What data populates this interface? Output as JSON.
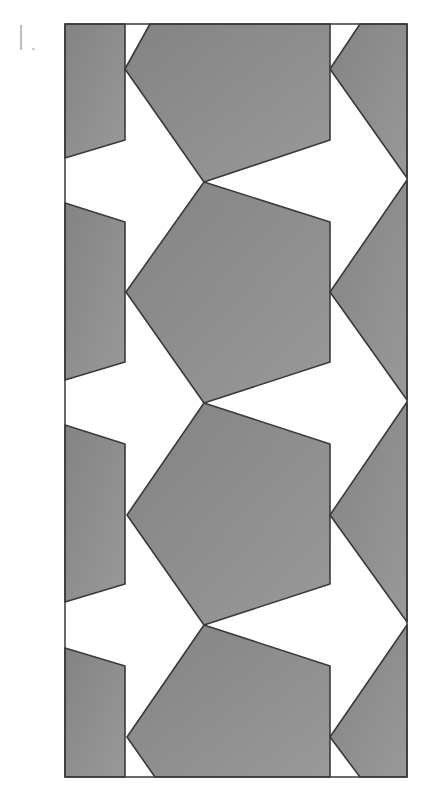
{
  "figure": {
    "label": "I."
  },
  "colors": {
    "tile_fill": "#8a8a8a",
    "tile_fill_light": "#9a9a9a",
    "tile_stroke": "#3a3a3a",
    "background": "#ffffff",
    "frame": "#3a3a3a",
    "label": "#b4b4b4"
  },
  "frame": {
    "x": 65,
    "y": 24,
    "width": 342,
    "height": 753
  },
  "tiles": [
    {
      "name": "left-tile-1",
      "points": "65,24 125,24 125,140 65,158"
    },
    {
      "name": "left-tile-2",
      "points": "65,203 125,222 125,362 65,380"
    },
    {
      "name": "left-tile-3",
      "points": "65,425 125,444 125,584 65,602"
    },
    {
      "name": "left-tile-4",
      "points": "65,648 125,666 125,777 65,777"
    },
    {
      "name": "center-tile-1",
      "points": "150,24 330,24 330,140 204,182 125,69"
    },
    {
      "name": "center-tile-2",
      "points": "204,182 330,222 330,362 204,403 126,292"
    },
    {
      "name": "center-tile-3",
      "points": "204,403 330,444 330,584 204,625 127,515"
    },
    {
      "name": "center-tile-4",
      "points": "204,625 330,666 330,777 155,777 127,737"
    },
    {
      "name": "right-tile-1",
      "points": "360,24 407,24 407,178 330,69"
    },
    {
      "name": "right-tile-2",
      "points": "407,180 407,400 330,292"
    },
    {
      "name": "right-tile-3",
      "points": "407,402 407,622 330,515"
    },
    {
      "name": "right-tile-4",
      "points": "407,625 407,777 360,777 330,737"
    }
  ]
}
